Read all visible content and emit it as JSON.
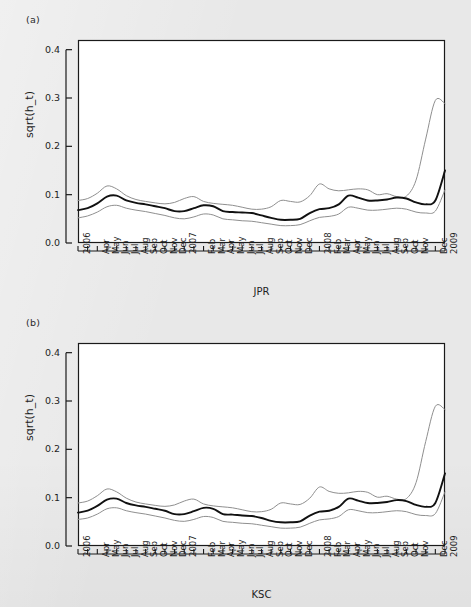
{
  "figure": {
    "background_color": "#e8e8e8",
    "plot_background_color": "#ffffff",
    "frame_color": "#1a1a1a",
    "center_line_color": "#111111",
    "band_line_color": "#8f8f8f"
  },
  "panels": [
    {
      "label": "(a)",
      "series_name": "JPR",
      "ylabel": "sqrt(h_t)"
    },
    {
      "label": "(b)",
      "series_name": "KSC",
      "ylabel": "sqrt(h_t)"
    }
  ],
  "axis": {
    "y_ticks": [
      "0.0",
      "0.1",
      "0.2",
      "0.3",
      "0.4"
    ],
    "y_tick_values": [
      0.0,
      0.1,
      0.2,
      0.3,
      0.4
    ],
    "ylim": [
      0.0,
      0.42
    ],
    "x_tick_labels": [
      "2006",
      "Apr",
      "May",
      "Jun",
      "Jul",
      "Aug",
      "Sep",
      "Oct",
      "Nov",
      "Dec",
      "2007",
      "Feb",
      "Mar",
      "Apr",
      "May",
      "Jun",
      "Jul",
      "Aug",
      "Sep",
      "Oct",
      "Nov",
      "Dec",
      "2008",
      "Feb",
      "Mar",
      "Apr",
      "May",
      "Jun",
      "Jul",
      "Aug",
      "Sep",
      "Oct",
      "Nov",
      "Dec",
      "2009",
      "Feb"
    ]
  },
  "chart_data": [
    {
      "type": "line",
      "title": "(a)",
      "xlabel": "JPR",
      "ylabel": "sqrt(h_t)",
      "ylim": [
        0.0,
        0.42
      ],
      "grid": false,
      "legend": "none",
      "x": [
        "2006-01",
        "2006-02",
        "2006-03",
        "2006-04",
        "2006-05",
        "2006-06",
        "2006-07",
        "2006-08",
        "2006-09",
        "2006-10",
        "2006-11",
        "2006-12",
        "2007-01",
        "2007-02",
        "2007-03",
        "2007-04",
        "2007-05",
        "2007-06",
        "2007-07",
        "2007-08",
        "2007-09",
        "2007-10",
        "2007-11",
        "2007-12",
        "2008-01",
        "2008-02",
        "2008-03",
        "2008-04",
        "2008-05",
        "2008-06",
        "2008-07",
        "2008-08",
        "2008-09",
        "2008-10",
        "2008-11",
        "2008-12",
        "2009-01",
        "2009-02",
        "2009-03"
      ],
      "series": [
        {
          "name": "upper band",
          "color": "#8f8f8f",
          "values": [
            0.088,
            0.092,
            0.103,
            0.118,
            0.112,
            0.098,
            0.09,
            0.086,
            0.083,
            0.081,
            0.084,
            0.092,
            0.096,
            0.086,
            0.082,
            0.08,
            0.078,
            0.074,
            0.07,
            0.07,
            0.075,
            0.088,
            0.086,
            0.085,
            0.098,
            0.122,
            0.112,
            0.108,
            0.11,
            0.112,
            0.11,
            0.1,
            0.102,
            0.096,
            0.097,
            0.13,
            0.215,
            0.295,
            0.288
          ]
        },
        {
          "name": "estimate",
          "color": "#111111",
          "values": [
            0.068,
            0.072,
            0.082,
            0.096,
            0.098,
            0.088,
            0.083,
            0.08,
            0.076,
            0.072,
            0.066,
            0.066,
            0.072,
            0.078,
            0.076,
            0.066,
            0.064,
            0.063,
            0.062,
            0.057,
            0.052,
            0.048,
            0.048,
            0.05,
            0.062,
            0.07,
            0.072,
            0.08,
            0.098,
            0.094,
            0.088,
            0.088,
            0.09,
            0.094,
            0.092,
            0.084,
            0.08,
            0.088,
            0.15
          ]
        },
        {
          "name": "lower band",
          "color": "#8f8f8f",
          "values": [
            0.052,
            0.056,
            0.064,
            0.075,
            0.078,
            0.072,
            0.068,
            0.065,
            0.061,
            0.057,
            0.052,
            0.05,
            0.054,
            0.06,
            0.058,
            0.05,
            0.048,
            0.046,
            0.045,
            0.042,
            0.039,
            0.036,
            0.036,
            0.038,
            0.046,
            0.053,
            0.055,
            0.06,
            0.074,
            0.072,
            0.068,
            0.068,
            0.07,
            0.072,
            0.07,
            0.064,
            0.062,
            0.066,
            0.11
          ]
        }
      ]
    },
    {
      "type": "line",
      "title": "(b)",
      "xlabel": "KSC",
      "ylabel": "sqrt(h_t)",
      "ylim": [
        0.0,
        0.42
      ],
      "grid": false,
      "legend": "none",
      "x": [
        "2006-01",
        "2006-02",
        "2006-03",
        "2006-04",
        "2006-05",
        "2006-06",
        "2006-07",
        "2006-08",
        "2006-09",
        "2006-10",
        "2006-11",
        "2006-12",
        "2007-01",
        "2007-02",
        "2007-03",
        "2007-04",
        "2007-05",
        "2007-06",
        "2007-07",
        "2007-08",
        "2007-09",
        "2007-10",
        "2007-11",
        "2007-12",
        "2008-01",
        "2008-02",
        "2008-03",
        "2008-04",
        "2008-05",
        "2008-06",
        "2008-07",
        "2008-08",
        "2008-09",
        "2008-10",
        "2008-11",
        "2008-12",
        "2009-01",
        "2009-02",
        "2009-03"
      ],
      "series": [
        {
          "name": "upper band",
          "color": "#8f8f8f",
          "values": [
            0.089,
            0.093,
            0.104,
            0.118,
            0.112,
            0.099,
            0.091,
            0.087,
            0.084,
            0.082,
            0.085,
            0.093,
            0.097,
            0.087,
            0.083,
            0.081,
            0.079,
            0.075,
            0.071,
            0.071,
            0.076,
            0.089,
            0.087,
            0.086,
            0.099,
            0.122,
            0.113,
            0.109,
            0.11,
            0.113,
            0.111,
            0.101,
            0.103,
            0.097,
            0.098,
            0.131,
            0.216,
            0.289,
            0.282
          ]
        },
        {
          "name": "estimate",
          "color": "#111111",
          "values": [
            0.069,
            0.073,
            0.083,
            0.096,
            0.098,
            0.089,
            0.084,
            0.081,
            0.077,
            0.073,
            0.066,
            0.066,
            0.072,
            0.079,
            0.077,
            0.066,
            0.065,
            0.063,
            0.062,
            0.058,
            0.052,
            0.049,
            0.049,
            0.051,
            0.063,
            0.071,
            0.073,
            0.081,
            0.098,
            0.094,
            0.089,
            0.089,
            0.091,
            0.095,
            0.093,
            0.085,
            0.081,
            0.089,
            0.15
          ]
        },
        {
          "name": "lower band",
          "color": "#8f8f8f",
          "values": [
            0.055,
            0.058,
            0.066,
            0.077,
            0.079,
            0.073,
            0.069,
            0.066,
            0.062,
            0.058,
            0.053,
            0.051,
            0.055,
            0.061,
            0.059,
            0.051,
            0.049,
            0.047,
            0.046,
            0.043,
            0.04,
            0.037,
            0.037,
            0.039,
            0.047,
            0.054,
            0.056,
            0.061,
            0.075,
            0.073,
            0.069,
            0.069,
            0.071,
            0.073,
            0.071,
            0.065,
            0.063,
            0.067,
            0.112
          ]
        }
      ]
    }
  ]
}
